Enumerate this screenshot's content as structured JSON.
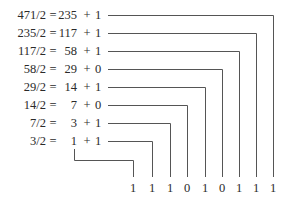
{
  "diagram": {
    "line_color": "#555555",
    "text_color": "#2a2a2a",
    "rows": [
      {
        "dividend": "471/2",
        "equals": "=",
        "quotient": "235",
        "plus": "+",
        "remainder": "1"
      },
      {
        "dividend": "235/2",
        "equals": "=",
        "quotient": "117",
        "plus": "+",
        "remainder": "1"
      },
      {
        "dividend": "117/2",
        "equals": "=",
        "quotient": "58",
        "plus": "+",
        "remainder": "1"
      },
      {
        "dividend": "58/2",
        "equals": "=",
        "quotient": "29",
        "plus": "+",
        "remainder": "0"
      },
      {
        "dividend": "29/2",
        "equals": "=",
        "quotient": "14",
        "plus": "+",
        "remainder": "1"
      },
      {
        "dividend": "14/2",
        "equals": "=",
        "quotient": "7",
        "plus": "+",
        "remainder": "0"
      },
      {
        "dividend": "7/2",
        "equals": "=",
        "quotient": "3",
        "plus": "+",
        "remainder": "1"
      },
      {
        "dividend": "3/2",
        "equals": "=",
        "quotient": "1",
        "plus": "+",
        "remainder": "1"
      }
    ],
    "binary_result": [
      "1",
      "1",
      "1",
      "0",
      "1",
      "0",
      "1",
      "1",
      "1"
    ]
  }
}
